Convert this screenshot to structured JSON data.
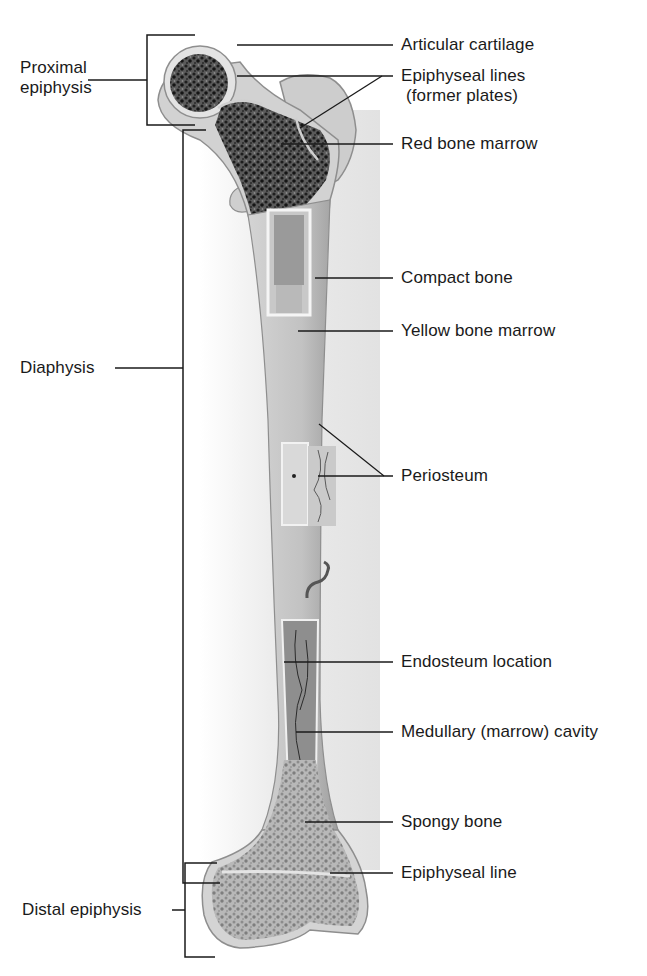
{
  "figure": {
    "colors": {
      "background": "#ffffff",
      "bone_surface": "#cfcfcf",
      "compact_bone": "#bdbdbd",
      "spongy_bone_dark": "#2b2b2b",
      "spongy_bone_light": "#9a9a9a",
      "cartilage": "#e4e4e4",
      "leader_line": "#1a1a1a"
    }
  },
  "left_labels": {
    "proximal_epiphysis": {
      "line1": "Proximal",
      "line2": "epiphysis"
    },
    "diaphysis": "Diaphysis",
    "distal_epiphysis": "Distal epiphysis"
  },
  "right_labels": {
    "articular_cartilage": "Articular cartilage",
    "epiphyseal_lines": {
      "line1": "Epiphyseal lines",
      "line2": "(former plates)"
    },
    "red_bone_marrow": "Red bone marrow",
    "compact_bone": "Compact bone",
    "yellow_bone_marrow": "Yellow bone marrow",
    "periosteum": "Periosteum",
    "endosteum_location": "Endosteum location",
    "medullary_cavity": "Medullary (marrow) cavity",
    "spongy_bone": "Spongy bone",
    "epiphyseal_line": "Epiphyseal line"
  }
}
